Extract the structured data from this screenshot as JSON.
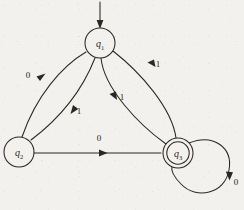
{
  "figure": {
    "kind": "finite-state-machine-diagram",
    "background_color": "#f3f1ee",
    "ink_color": "#2b2722"
  },
  "states": [
    {
      "id": "q1",
      "label": "q",
      "subscript": "1",
      "accepting": false,
      "start": true,
      "cx": 100,
      "cy": 43,
      "r": 15
    },
    {
      "id": "q2",
      "label": "q",
      "subscript": "2",
      "accepting": false,
      "start": false,
      "cx": 19,
      "cy": 152,
      "r": 15
    },
    {
      "id": "q3",
      "label": "q",
      "subscript": "3",
      "accepting": true,
      "start": false,
      "cx": 178,
      "cy": 153,
      "r": 15,
      "inner_r": 11
    }
  ],
  "start_arrow": {
    "name": "start-arrow",
    "from_x": 100,
    "from_y": 2,
    "to_x": 100,
    "to_y": 28
  },
  "transitions": [
    {
      "from": "q1",
      "to": "q2",
      "symbol": "0",
      "label_x": 28,
      "label_y": 78
    },
    {
      "from": "q2",
      "to": "q1",
      "symbol": "1",
      "label_x": 79,
      "label_y": 114
    },
    {
      "from": "q1",
      "to": "q3",
      "symbol": "1",
      "label_x": 122,
      "label_y": 100
    },
    {
      "from": "q3",
      "to": "q1",
      "symbol": "1",
      "label_x": 158,
      "label_y": 67
    },
    {
      "from": "q2",
      "to": "q3",
      "symbol": "0",
      "label_x": 99,
      "label_y": 141
    },
    {
      "from": "q3",
      "to": "q3",
      "symbol": "0",
      "label_x": 232,
      "label_y": 185
    }
  ]
}
